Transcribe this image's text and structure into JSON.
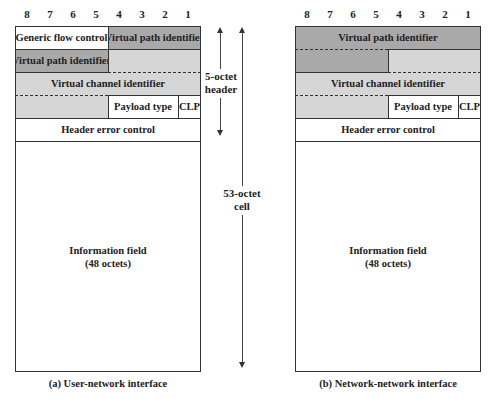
{
  "bit_numbers": [
    "8",
    "7",
    "6",
    "5",
    "4",
    "3",
    "2",
    "1"
  ],
  "uni": {
    "fields": {
      "gfc": "Generic flow control",
      "vpi_top": "Virtual path identifier",
      "vpi_bottom": "Virtual path identifier",
      "vci": "Virtual channel identifier",
      "payload_type": "Payload type",
      "clp": "CLP",
      "hec": "Header error control",
      "info_line1": "Information field",
      "info_line2": "(48 octets)"
    },
    "caption": "(a) User-network interface"
  },
  "nni": {
    "fields": {
      "vpi": "Virtual path identifier",
      "vci": "Virtual channel identifier",
      "payload_type": "Payload type",
      "clp": "CLP",
      "hec": "Header error control",
      "info_line1": "Information field",
      "info_line2": "(48 octets)"
    },
    "caption": "(b) Network-network interface"
  },
  "annotations": {
    "header_line1": "5-octet",
    "header_line2": "header",
    "cell_line1": "53-octet",
    "cell_line2": "cell"
  },
  "colors": {
    "dark_fill": "#a9a9a9",
    "light_fill": "#d6d6d6",
    "border": "#333333"
  }
}
